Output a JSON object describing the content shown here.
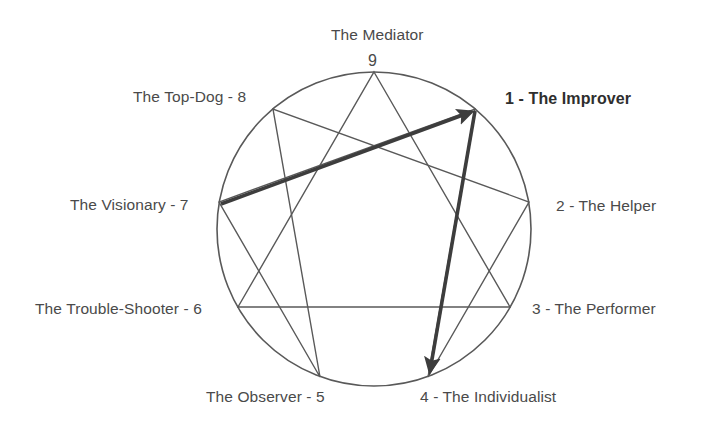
{
  "diagram": {
    "type": "enneagram",
    "circle": {
      "cx": 374,
      "cy": 229,
      "r": 157,
      "stroke": "#595959",
      "stroke_width": 1.6
    },
    "line_color": "#595959",
    "arrow_color": "#3d3d3d",
    "points": [
      {
        "number": "9",
        "name": "The Mediator",
        "label_text": "The Mediator",
        "numeral": "9",
        "label_side": "top",
        "angle_deg": -90,
        "x": 374,
        "y": 72,
        "bold": false
      },
      {
        "number": "1",
        "name": "The Improver",
        "label_text": "1 - The Improver",
        "label_side": "right",
        "angle_deg": -50,
        "x": 475,
        "y": 109,
        "bold": true
      },
      {
        "number": "2",
        "name": "The Helper",
        "label_text": "2 - The Helper",
        "label_side": "right",
        "angle_deg": -10,
        "x": 529,
        "y": 202,
        "bold": false
      },
      {
        "number": "3",
        "name": "The Performer",
        "label_text": "3 - The Performer",
        "label_side": "right",
        "angle_deg": 30,
        "x": 510,
        "y": 307,
        "bold": false
      },
      {
        "number": "4",
        "name": "The Individualist",
        "label_text": "4 - The Individualist",
        "label_side": "bottom",
        "angle_deg": 70,
        "x": 428,
        "y": 377,
        "bold": false
      },
      {
        "number": "5",
        "name": "The Observer",
        "label_text": "The Observer - 5",
        "label_side": "bottom",
        "angle_deg": 110,
        "x": 320,
        "y": 377,
        "bold": false
      },
      {
        "number": "6",
        "name": "The Trouble-Shooter",
        "label_text": "The Trouble-Shooter - 6",
        "label_side": "left",
        "angle_deg": 150,
        "x": 238,
        "y": 307,
        "bold": false
      },
      {
        "number": "7",
        "name": "The Visionary",
        "label_text": "The Visionary - 7",
        "label_side": "left",
        "angle_deg": 190,
        "x": 219,
        "y": 202,
        "bold": false
      },
      {
        "number": "8",
        "name": "The Top-Dog",
        "label_text": "The Top-Dog - 8",
        "label_side": "left",
        "angle_deg": 230,
        "x": 273,
        "y": 109,
        "bold": false
      }
    ],
    "triangle": {
      "name": "inner-triangle-9-3-6",
      "vertices": [
        "9",
        "3",
        "6"
      ]
    },
    "hexad": {
      "name": "hexad-1-4-2-8-5-7",
      "sequence": [
        "1",
        "4",
        "2",
        "8",
        "5",
        "7"
      ]
    },
    "arrows": [
      {
        "name": "arrow-7-to-1",
        "from": "7",
        "to": "1",
        "bold": true
      },
      {
        "name": "arrow-1-to-4",
        "from": "1",
        "to": "4",
        "bold": true
      }
    ]
  }
}
